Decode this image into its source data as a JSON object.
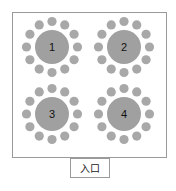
{
  "diagram": {
    "type": "seating-layout",
    "room": {
      "x": 12.5,
      "y": 12.5,
      "width": 154,
      "height": 145,
      "border_color": "#9a9a9a"
    },
    "table_color": "#a0a0a0",
    "chair_color": "#a8a8a8",
    "table_radius": 17,
    "chair_radius": 4.6,
    "chair_orbit": 25.5,
    "chairs_per_table": 12,
    "tables": [
      {
        "label": "1",
        "cx": 52,
        "cy": 47
      },
      {
        "label": "2",
        "cx": 124,
        "cy": 47
      },
      {
        "label": "3",
        "cx": 52,
        "cy": 114
      },
      {
        "label": "4",
        "cx": 124,
        "cy": 114
      }
    ],
    "entrance": {
      "label": "入口",
      "x": 70.5,
      "y": 158.5,
      "width": 39,
      "height": 19
    }
  }
}
